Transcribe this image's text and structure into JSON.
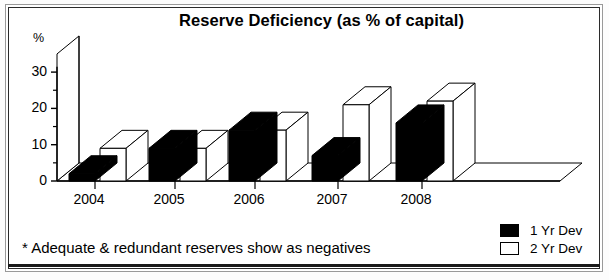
{
  "chart_data": {
    "type": "bar",
    "title": "Reserve Deficiency (as % of capital)",
    "subtitle": "",
    "xlabel": "",
    "ylabel": "%",
    "ylim": [
      0,
      35
    ],
    "yticks": [
      0,
      10,
      20,
      30
    ],
    "ytick_labels": [
      "0",
      "10",
      "20",
      "30"
    ],
    "minor_yticks": [
      5,
      15,
      25,
      35
    ],
    "grid": false,
    "legend_position": "bottom-right",
    "three_d": true,
    "categories": [
      "2004",
      "2005",
      "2006",
      "2007",
      "2008"
    ],
    "series": [
      {
        "name": "1 Yr Dev",
        "color": "#000000",
        "values": [
          2,
          9,
          14,
          7,
          16
        ]
      },
      {
        "name": "2 Yr Dev",
        "color": "#ffffff",
        "values": [
          9,
          9,
          14,
          21,
          22
        ]
      }
    ],
    "annotations": [
      "* Adequate & redundant reserves show as negatives"
    ]
  },
  "chart": {
    "title": "Reserve Deficiency (as % of capital)",
    "y_unit": "%",
    "footnote": "* Adequate & redundant reserves show as negatives",
    "x_tick_labels": [
      "2004",
      "2005",
      "2006",
      "2007",
      "2008"
    ],
    "y_tick_labels": [
      "0",
      "10",
      "20",
      "30"
    ]
  },
  "legend": {
    "items": [
      {
        "label": "1 Yr Dev",
        "swatch": "filled-black-square"
      },
      {
        "label": "2 Yr Dev",
        "swatch": "hollow-white-square"
      }
    ]
  }
}
